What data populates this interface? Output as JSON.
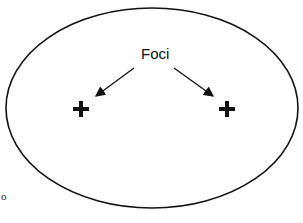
{
  "diagram": {
    "title_label": "Foci",
    "stray_char": "o",
    "ellipse": {
      "cx": 152,
      "cy": 108,
      "rx": 146,
      "ry": 100,
      "stroke": "#111111"
    },
    "foci": [
      {
        "name": "left-focus",
        "x": 80,
        "y": 109,
        "symbol": "+"
      },
      {
        "name": "right-focus",
        "x": 226,
        "y": 109,
        "symbol": "+"
      }
    ]
  }
}
